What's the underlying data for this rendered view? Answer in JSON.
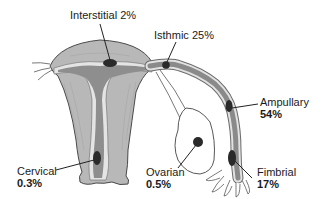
{
  "diagram": {
    "colors": {
      "tissue_light": "#bdbdbd",
      "tissue_mid": "#9a9a9a",
      "cavity": "#8c8c8c",
      "lining": "#e6e6e6",
      "implant": "#2a2a2a",
      "outline": "#4a4a4a"
    },
    "sites": [
      {
        "id": "interstitial",
        "name": "Interstitial",
        "percent": "2%"
      },
      {
        "id": "isthmic",
        "name": "Isthmic",
        "percent": "25%"
      },
      {
        "id": "ampullary",
        "name": "Ampullary",
        "percent": "54%"
      },
      {
        "id": "fimbrial",
        "name": "Fimbrial",
        "percent": "17%"
      },
      {
        "id": "ovarian",
        "name": "Ovarian",
        "percent": "0.5%"
      },
      {
        "id": "cervical",
        "name": "Cervical",
        "percent": "0.3%"
      }
    ]
  }
}
